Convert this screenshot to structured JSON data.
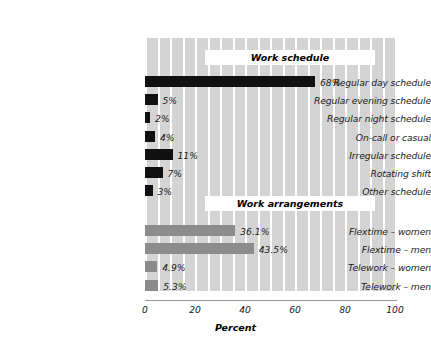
{
  "chart_data": {
    "type": "bar",
    "orientation": "horizontal",
    "title": "",
    "xlabel": "Percent",
    "ylabel": "",
    "xlim": [
      0,
      100
    ],
    "xticks": [
      0,
      20,
      40,
      60,
      80,
      100
    ],
    "xtick_labels": [
      "0",
      "20",
      "40",
      "60",
      "80",
      "100"
    ],
    "grid": true,
    "grid_axis": "x",
    "grid_step": 5,
    "legend": "none",
    "groups": [
      {
        "name": "Work schedule",
        "color": "#111111",
        "categories": [
          "Regular day schedule",
          "Regular evening schedule",
          "Regular night schedule",
          "On-call or casual",
          "Irregular schedule",
          "Rotating shift",
          "Other schedule"
        ],
        "values": [
          68,
          5,
          2,
          4,
          11,
          7,
          3
        ],
        "value_labels": [
          "68%",
          "5%",
          "2%",
          "4%",
          "11%",
          "7%",
          "3%"
        ]
      },
      {
        "name": "Work arrangements",
        "color": "#8c8c8c",
        "categories": [
          "Flextime – women",
          "Flextime – men",
          "Telework – women",
          "Telework – men"
        ],
        "values": [
          36.1,
          43.5,
          4.9,
          5.3
        ],
        "value_labels": [
          "36.1%",
          "43.5%",
          "4.9%",
          "5.3%"
        ]
      }
    ]
  },
  "colors": {
    "plot_background": "#d4d4d4",
    "gridline": "#ffffff",
    "bar_dark": "#111111",
    "bar_gray": "#8c8c8c",
    "axis_line": "#9a9a9a",
    "text": "#1a1a1a",
    "banner_background": "#ffffff"
  },
  "banners": {
    "work_schedule": "Work schedule",
    "work_arrangements": "Work arrangements"
  },
  "axis": {
    "title": "Percent",
    "ticks": [
      "0",
      "20",
      "40",
      "60",
      "80",
      "100"
    ]
  }
}
